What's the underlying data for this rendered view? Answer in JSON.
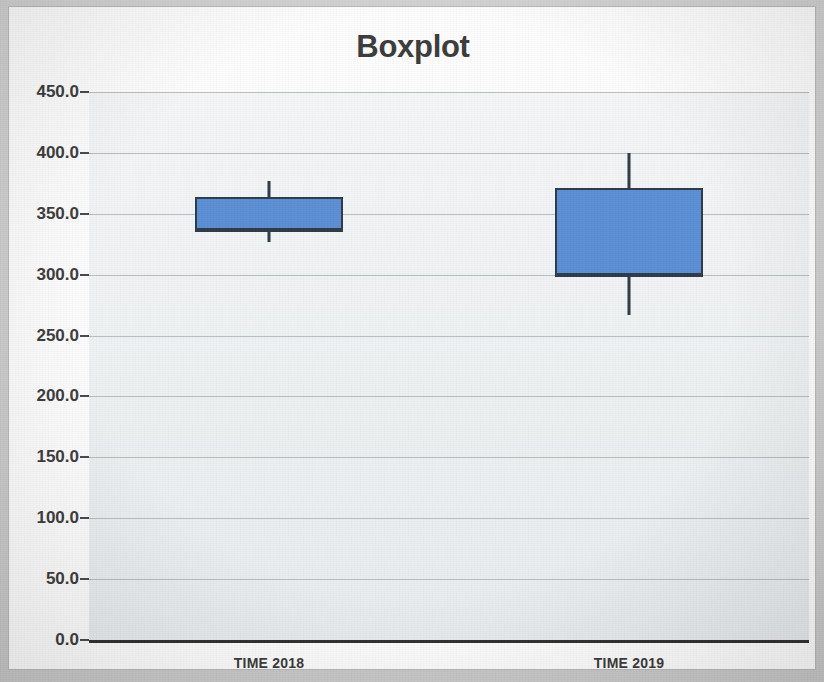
{
  "chart_data": {
    "type": "box",
    "title": "Boxplot",
    "xlabel": "",
    "ylabel": "",
    "categories": [
      "TIME 2018",
      "TIME 2019"
    ],
    "ylim": [
      0.0,
      450.0
    ],
    "ytick_step": 50.0,
    "ytick_labels": [
      "450.0",
      "400.0",
      "350.0",
      "300.0",
      "250.0",
      "200.0",
      "150.0",
      "100.0",
      "50.0",
      "0.0"
    ],
    "ytick_values": [
      450.0,
      400.0,
      350.0,
      300.0,
      250.0,
      200.0,
      150.0,
      100.0,
      50.0,
      0.0
    ],
    "grid": true,
    "legend": false,
    "box_fill_color": "#5b8ed6",
    "box_line_color": "#2e3a46",
    "plot_background_color": "#eef1f2",
    "boxes": [
      {
        "category": "TIME 2018",
        "whisker_low": 327.0,
        "q1": 337.0,
        "median": 337.0,
        "q3": 364.0,
        "whisker_high": 377.0
      },
      {
        "category": "TIME 2019",
        "whisker_low": 267.0,
        "q1": 300.0,
        "median": 300.0,
        "q3": 371.0,
        "whisker_high": 400.0
      }
    ]
  }
}
